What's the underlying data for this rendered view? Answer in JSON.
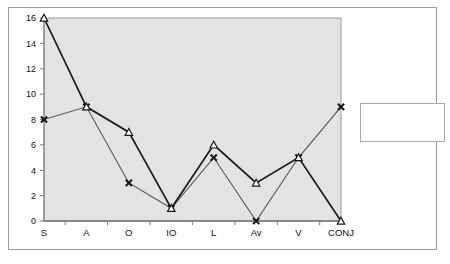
{
  "chart_data": {
    "type": "line",
    "title": "",
    "xlabel": "",
    "ylabel": "",
    "categories": [
      "S",
      "A",
      "O",
      "IO",
      "L",
      "Av",
      "V",
      "CONJ"
    ],
    "ylim": [
      0,
      16
    ],
    "yticks": [
      0,
      2,
      4,
      6,
      8,
      10,
      12,
      14,
      16
    ],
    "grid": false,
    "legend_position": "right",
    "series": [
      {
        "name": "Initial: WS",
        "marker": "open-triangle",
        "line": "solid",
        "color": "#1a1a1a",
        "values": [
          16,
          9,
          7,
          1,
          6,
          3,
          5,
          0
        ]
      },
      {
        "name": "Initial: K&S",
        "marker": "bold-x",
        "line": "thin",
        "color": "#555555",
        "values": [
          8,
          9,
          3,
          1,
          5,
          0,
          5,
          9
        ]
      }
    ]
  },
  "axis": {
    "ytick_labels": [
      "0",
      "2",
      "4",
      "6",
      "8",
      "10",
      "12",
      "14",
      "16"
    ],
    "xtick_labels": [
      "S",
      "A",
      "O",
      "IO",
      "L",
      "Av",
      "V",
      "CONJ"
    ]
  },
  "legend": {
    "entries": [
      {
        "label": "Initial: WS",
        "marker": "open-triangle-icon"
      },
      {
        "label": "Initial: K&S",
        "marker": "bold-x-icon"
      }
    ]
  },
  "colors": {
    "plot_background": "#e3e3e3",
    "figure_background": "#ffffff",
    "frame": "#9a9a9a",
    "axis": "#7a7a7a",
    "series_ws": "#1a1a1a",
    "series_ks": "#555555"
  }
}
